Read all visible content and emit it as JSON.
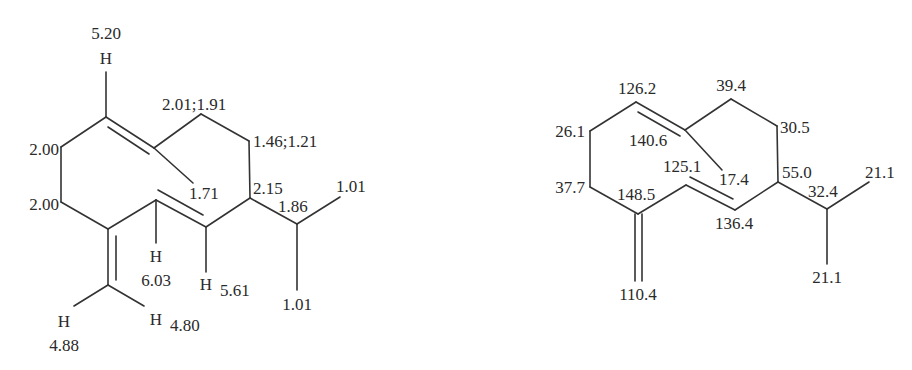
{
  "figure": {
    "left_structure": {
      "title": "1H NMR chemical shifts (germacrene D)",
      "labels": {
        "h_top_value": "5.20",
        "h_top_atom": "H",
        "ch2_a": "2.01;1.91",
        "ch2_b": "1.46;1.21",
        "ch2_c": "2.00",
        "ch2_d": "2.00",
        "methyl_vinyl": "1.71",
        "ch_ring": "2.15",
        "ch_isopropyl": "1.86",
        "methyl_iso_a": "1.01",
        "methyl_iso_b": "1.01",
        "h_603_atom": "H",
        "h_603_value": "6.03",
        "h_561_atom": "H",
        "h_561_value": "5.61",
        "h_488_atom": "H",
        "h_488_value": "4.88",
        "h_480_atom": "H",
        "h_480_value": "4.80"
      }
    },
    "right_structure": {
      "title": "13C NMR chemical shifts (germacrene D)",
      "labels": {
        "c_1262": "126.2",
        "c_394": "39.4",
        "c_261": "26.1",
        "c_1406": "140.6",
        "c_305": "30.5",
        "c_1251": "125.1",
        "c_174": "17.4",
        "c_377": "37.7",
        "c_1485": "148.5",
        "c_550": "55.0",
        "c_324": "32.4",
        "c_211_a": "21.1",
        "c_1364": "136.4",
        "c_211_b": "21.1",
        "c_1104": "110.4"
      }
    }
  }
}
